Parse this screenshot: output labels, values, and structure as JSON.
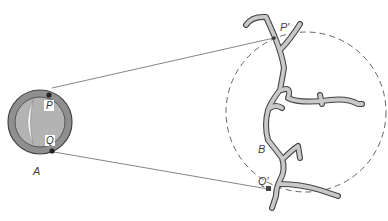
{
  "diagram": {
    "type": "magnified-view",
    "labels": {
      "A": "A",
      "P": "P",
      "Q": "Q",
      "P_prime": "P′",
      "Q_prime": "Q′",
      "B": "B"
    },
    "colors": {
      "line": "#555555",
      "ring_fill": "#9a9a9a",
      "inner_fill": "#b5b5b5",
      "vessel_fill": "#c8c8c8",
      "vessel_stroke": "#444444",
      "dashed_circle": "#555555"
    }
  }
}
